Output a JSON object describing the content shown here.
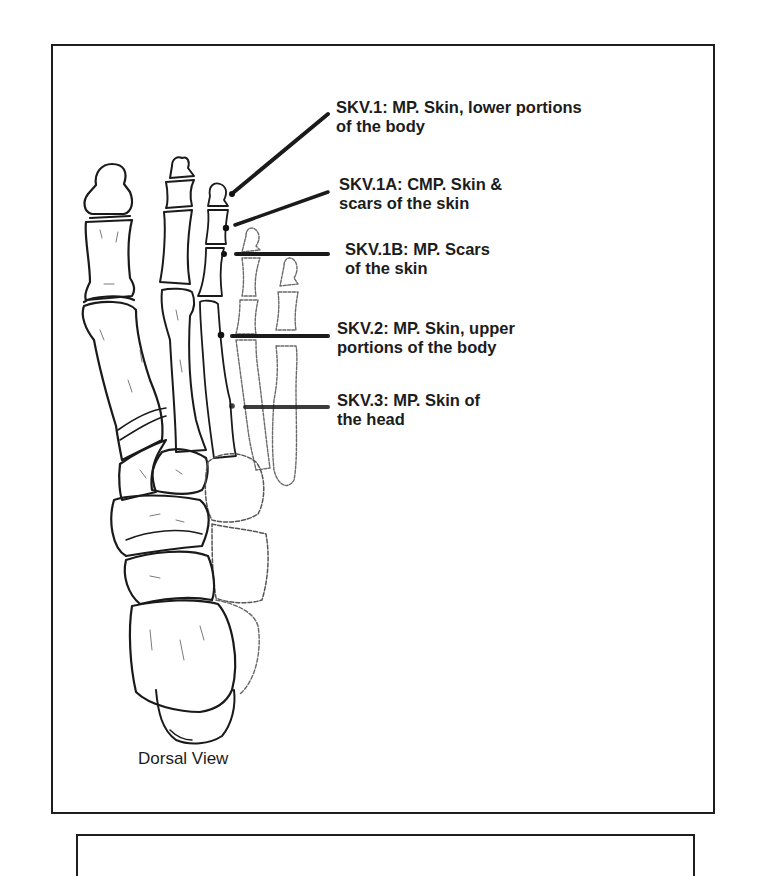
{
  "figure": {
    "view_caption": "Dorsal View",
    "annotations": [
      {
        "id": "SKV.1",
        "lines": [
          "SKV.1:  MP.  Skin, lower portions",
          "of the body"
        ],
        "point": [
          234,
          192
        ]
      },
      {
        "id": "SKV.1A",
        "lines": [
          "SKV.1A:  CMP. Skin &",
          "scars of the skin"
        ],
        "point": [
          226,
          228
        ]
      },
      {
        "id": "SKV.1B",
        "lines": [
          "SKV.1B:  MP.  Scars",
          "of the skin"
        ],
        "point": [
          224,
          254
        ]
      },
      {
        "id": "SKV.2",
        "lines": [
          "SKV.2:  MP. Skin, upper",
          "portions of the body"
        ],
        "point": [
          221,
          335
        ]
      },
      {
        "id": "SKV.3",
        "lines": [
          "SKV.3:  MP. Skin of",
          "the head"
        ],
        "point": [
          232,
          406
        ]
      }
    ]
  }
}
